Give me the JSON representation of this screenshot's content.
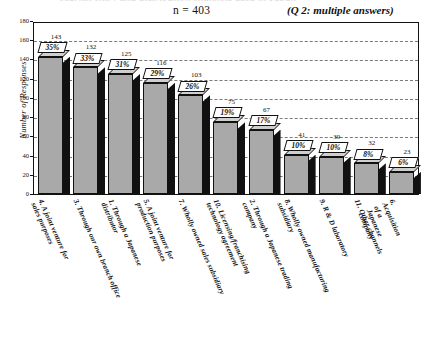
{
  "header": {
    "sample_size": "n = 403",
    "question_note": "(Q 2: multiple answers)",
    "cut_title": "Market entry and distribution channels used in Japan"
  },
  "axes": {
    "y_title": "Number of Responses",
    "y_ticks": [
      "0",
      "20",
      "40",
      "60",
      "80",
      "100",
      "120",
      "140",
      "160",
      "180"
    ]
  },
  "chart_data": {
    "type": "bar",
    "title": "",
    "subtitle": "n = 403",
    "annotations": [
      "n = 403",
      "(Q 2: multiple answers)"
    ],
    "xlabel": "",
    "ylabel": "Number of Responses",
    "ylim": [
      0,
      180
    ],
    "ytick_step": 20,
    "grid": true,
    "legend": "none",
    "categories": [
      "4. A joint venture for\nsales purposes",
      "3. Through our own branch office",
      "1. Through a Japanese\ndistributor",
      "5. A joint venture for\nproduction purposes",
      "7. Wholly owned sales subsidiary",
      "10. Licensing/franchising\ntechnology agreement",
      "2. Through a Japanese trading\ncompany",
      "8. Wholly owned manufacturing\nsubsidiary",
      "9. R & D laboratory",
      "11. Other channels",
      "6. Acquisition of a\nJapanese company"
    ],
    "values": [
      143,
      132,
      125,
      116,
      103,
      75,
      67,
      41,
      39,
      32,
      23
    ],
    "percent_labels": [
      "35%",
      "33%",
      "31%",
      "29%",
      "26%",
      "19%",
      "17%",
      "10%",
      "10%",
      "8%",
      "6%"
    ]
  },
  "colors": {
    "bar_face": "#a9a9a9",
    "bar_side": "#111111",
    "bar_top": "#cfcfcf",
    "axis": "#111111",
    "grid": "#7a7a7a",
    "callout_bg": "#ffffff"
  }
}
